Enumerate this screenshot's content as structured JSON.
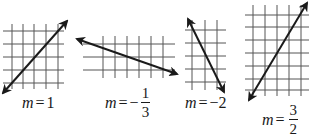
{
  "figure": {
    "colors": {
      "line": "#1a1a1a",
      "grid": "#555555",
      "background": "#ffffff"
    },
    "graphs": [
      {
        "id": "graph-1",
        "label": {
          "var": "m",
          "eq": "=",
          "value": "1"
        },
        "slope": 1,
        "grid": {
          "vx": [
            12,
            23,
            34,
            46,
            58
          ],
          "hy": [
            31,
            44,
            57,
            70,
            83
          ],
          "x0": 3,
          "x1": 64,
          "y0": 24,
          "y1": 89
        },
        "line": {
          "x1": 3,
          "y1": 93,
          "x2": 67,
          "y2": 21
        }
      },
      {
        "id": "graph-2",
        "label": {
          "var": "m",
          "eq": "=",
          "sign": "−",
          "num": "1",
          "den": "3"
        },
        "slope": -0.3333,
        "grid": {
          "vx": [
            103,
            115,
            127,
            139,
            151,
            163
          ],
          "hy": [
            44,
            57,
            70
          ],
          "x0": 83,
          "x1": 175,
          "y0": 36,
          "y1": 78
        },
        "line": {
          "x1": 77,
          "y1": 39,
          "x2": 177,
          "y2": 74
        }
      },
      {
        "id": "graph-3",
        "label": {
          "var": "m",
          "eq": "=",
          "value": "−2"
        },
        "slope": -2,
        "grid": {
          "vx": [
            192,
            205,
            217
          ],
          "hy": [
            30,
            43,
            56,
            69,
            82
          ],
          "x0": 185,
          "x1": 226,
          "y0": 20,
          "y1": 90
        },
        "line": {
          "x1": 188,
          "y1": 19,
          "x2": 224,
          "y2": 92
        }
      },
      {
        "id": "graph-4",
        "label": {
          "var": "m",
          "eq": "=",
          "num": "3",
          "den": "2"
        },
        "slope": 1.5,
        "grid": {
          "vx": [
            253,
            265,
            277,
            289,
            301
          ],
          "hy": [
            15,
            27,
            40,
            53,
            66,
            79,
            90
          ],
          "x0": 245,
          "x1": 309,
          "y0": 5,
          "y1": 96
        },
        "line": {
          "x1": 249,
          "y1": 100,
          "x2": 307,
          "y2": 3
        }
      }
    ]
  }
}
